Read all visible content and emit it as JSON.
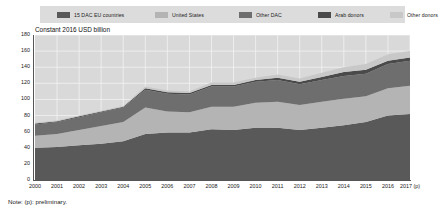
{
  "axis_title": "Constant 2016 USD billion",
  "note": "Note: (p): preliminary.",
  "legend": {
    "items": [
      {
        "label": "15 DAC EU countries",
        "color": "#595959"
      },
      {
        "label": "United States",
        "color": "#b4b4b4"
      },
      {
        "label": "Other DAC",
        "color": "#6e6e6e"
      },
      {
        "label": "Arab donors",
        "color": "#4a4a4a"
      },
      {
        "label": "Other donors",
        "color": "#c8c8c8"
      }
    ]
  },
  "chart_data": {
    "type": "area",
    "stacked": true,
    "title": "",
    "subtitle": "",
    "xlabel": "",
    "ylabel": "Constant 2016 USD billion",
    "ylim": [
      0,
      180
    ],
    "ytick_step": 20,
    "yticks": [
      0,
      20,
      40,
      60,
      80,
      100,
      120,
      140,
      160,
      180
    ],
    "grid": true,
    "legend_position": "top",
    "categories": [
      "2000",
      "2001",
      "2002",
      "2003",
      "2004",
      "2005",
      "2006",
      "2007",
      "2008",
      "2009",
      "2010",
      "2011",
      "2012",
      "2013",
      "2014",
      "2015",
      "2016",
      "2017 (p)"
    ],
    "series": [
      {
        "name": "15 DAC EU countries",
        "color": "#595959",
        "values": [
          40,
          41,
          43,
          45,
          48,
          57,
          59,
          59,
          63,
          62,
          65,
          65,
          62,
          65,
          68,
          72,
          80,
          82
        ]
      },
      {
        "name": "United States",
        "color": "#b4b4b4",
        "values": [
          15,
          16,
          19,
          22,
          24,
          33,
          26,
          25,
          28,
          29,
          31,
          32,
          31,
          32,
          33,
          32,
          34,
          35
        ]
      },
      {
        "name": "Other DAC",
        "color": "#6e6e6e",
        "values": [
          14,
          15,
          16,
          17,
          18,
          22,
          22,
          22,
          25,
          25,
          26,
          27,
          26,
          27,
          28,
          28,
          30,
          31
        ]
      },
      {
        "name": "Arab donors",
        "color": "#4a4a4a",
        "values": [
          1,
          1,
          1,
          1,
          1,
          2,
          2,
          2,
          2,
          2,
          2,
          3,
          3,
          4,
          5,
          5,
          4,
          4
        ]
      },
      {
        "name": "Other donors",
        "color": "#c8c8c8",
        "values": [
          1,
          1,
          1,
          1,
          1,
          2,
          2,
          2,
          3,
          3,
          3,
          4,
          4,
          5,
          6,
          7,
          8,
          8
        ]
      }
    ],
    "totals": [
      71,
      74,
      80,
      86,
      92,
      116,
      111,
      110,
      121,
      121,
      127,
      131,
      126,
      133,
      140,
      144,
      156,
      160
    ]
  }
}
